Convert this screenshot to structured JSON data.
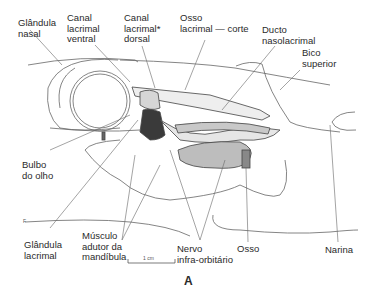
{
  "figure": {
    "letter": "A",
    "scale_bar": "1 cm",
    "corner_mark": "F"
  },
  "labels": {
    "glandula_nasal": "Glândula\nnasal",
    "canal_lacrimal_ventral": "Canal\nlacrimal\nventral",
    "canal_lacrimal_dorsal": "Canal\nlacrimal*\ndorsal",
    "osso_lacrimal_corte": "Osso\nlacrimal — corte",
    "ducto_nasolacrimal": "Ducto\nnasolacrimal",
    "bico_superior": "Bico\nsuperior",
    "bulbo_do_olho": "Bulbo\ndo olho",
    "glandula_lacrimal": "Glândula\nlacrimal",
    "musculo_adutor": "Músculo\nadutor da\nmandíbula",
    "nervo_infra_orbitario": "Nervo\ninfra-orbitário",
    "osso": "Osso",
    "narina": "Narina"
  },
  "colors": {
    "line": "#555555",
    "dark_fill": "#3a3a3a",
    "mid_fill": "#bdbdbd",
    "light_fill": "#e4e4e4"
  }
}
